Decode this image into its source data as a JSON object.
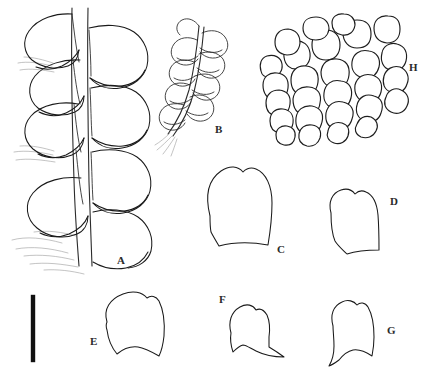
{
  "plate": {
    "title": "Botanical line-drawing plate",
    "background_color": "#ffffff",
    "ink_color": "#1a1a1a",
    "width": 423,
    "height": 378,
    "caption": ""
  },
  "scale_bar": {
    "name": "scale-bar",
    "orientation": "vertical",
    "color": "#111111",
    "x": 33,
    "y_top": 295,
    "y_bottom": 362,
    "thickness": 4,
    "label": ""
  },
  "figures": [
    {
      "key": "A",
      "label": "A",
      "name": "figure-a-shoot-habit",
      "description": "Portion of leafy shoot with stem, overlapping lateral leaves and rhizoids",
      "label_x": 117,
      "label_y": 264
    },
    {
      "key": "B",
      "label": "B",
      "name": "figure-b-branch-habit",
      "description": "Slender branch with small closely imbricate leaves",
      "label_x": 215,
      "label_y": 133
    },
    {
      "key": "C",
      "label": "C",
      "name": "figure-c-leaf",
      "description": "Single large leaf, broadly ovate with truncate base",
      "label_x": 277,
      "label_y": 253
    },
    {
      "key": "D",
      "label": "D",
      "name": "figure-d-leaf",
      "description": "Single leaf, ovate with sinuate base",
      "label_x": 390,
      "label_y": 205
    },
    {
      "key": "E",
      "label": "E",
      "name": "figure-e-leaf",
      "description": "Single leaf, obliquely ovate with undulate base",
      "label_x": 90,
      "label_y": 345
    },
    {
      "key": "F",
      "label": "F",
      "name": "figure-f-leaf",
      "description": "Small falcate leaf with acute apex",
      "label_x": 219,
      "label_y": 303
    },
    {
      "key": "G",
      "label": "G",
      "name": "figure-g-leaf",
      "description": "Small leaf with rounded apex and decurrent base",
      "label_x": 387,
      "label_y": 334
    },
    {
      "key": "H",
      "label": "H",
      "name": "figure-h-cells",
      "description": "Leaf cell network, rounded-quadrate to oval cells",
      "label_x": 409,
      "label_y": 71
    }
  ]
}
